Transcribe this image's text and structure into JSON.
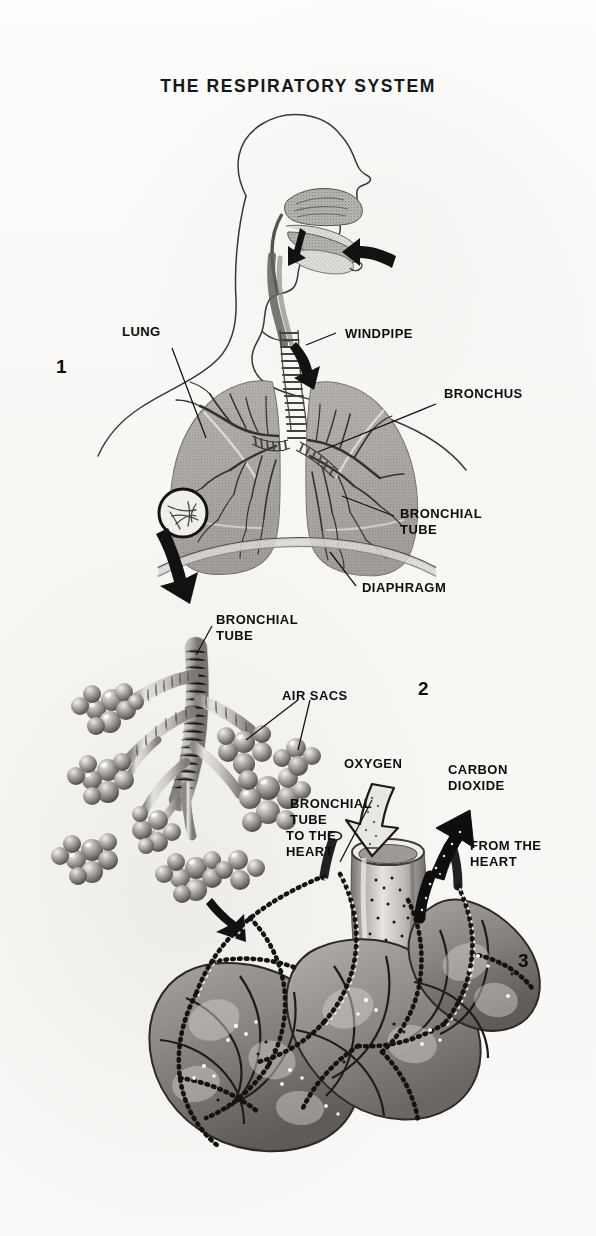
{
  "document": {
    "title": "THE RESPIRATORY SYSTEM",
    "type": "educational anatomical illustration",
    "background_color": "#faf9f7",
    "ink_color": "#111111"
  },
  "panels": [
    {
      "number": "1",
      "subject": "torso-head-lungs-overview",
      "labels": [
        "LUNG",
        "WINDPIPE",
        "BRONCHUS",
        "BRONCHIAL\nTUBE",
        "DIAPHRAGM"
      ]
    },
    {
      "number": "2",
      "subject": "bronchial-tree-with-alveolar-clusters",
      "labels": [
        "BRONCHIAL\nTUBE",
        "AIR  SACS"
      ]
    },
    {
      "number": "3",
      "subject": "alveoli-capillary-gas-exchange",
      "labels": [
        "OXYGEN",
        "CARBON\nDIOXIDE",
        "BRONCHIAL\nTUBE",
        "TO THE\nHEART",
        "FROM  THE\nHEART"
      ]
    }
  ],
  "labels": {
    "lung": "LUNG",
    "windpipe": "WINDPIPE",
    "bronchus": "BRONCHUS",
    "bronchial_tube_1": "BRONCHIAL\nTUBE",
    "diaphragm": "DIAPHRAGM",
    "bronchial_tube_2": "BRONCHIAL\nTUBE",
    "air_sacs": "AIR  SACS",
    "oxygen": "OXYGEN",
    "carbon_dioxide": "CARBON\nDIOXIDE",
    "bronchial_tube_3": "BRONCHIAL\nTUBE",
    "to_the_heart": "TO THE\nHEART",
    "from_the_heart": "FROM  THE\nHEART"
  },
  "panel_numbers": {
    "one": "1",
    "two": "2",
    "three": "3"
  }
}
